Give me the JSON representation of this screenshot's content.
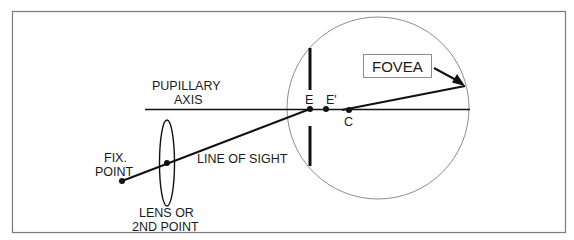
{
  "diagram": {
    "colors": {
      "background": "#ffffff",
      "frame": "#7a7a7a",
      "lines": "#111111",
      "circle": "#808080"
    },
    "labels": {
      "pupillary_axis_line1": "PUPILLARY",
      "pupillary_axis_line2": "AXIS",
      "fix_point_line1": "FIX.",
      "fix_point_line2": "POINT",
      "line_of_sight": "LINE OF SIGHT",
      "lens_line1": "LENS OR",
      "lens_line2": "2ND POINT",
      "fovea": "FOVEA",
      "point_e": "E",
      "point_e_prime": "E'",
      "point_c": "C"
    },
    "points": {
      "fix_point": [
        122,
        181
      ],
      "lens_point": [
        167,
        163
      ],
      "E": [
        310,
        109
      ],
      "E_prime": [
        326,
        109
      ],
      "C": [
        349,
        110
      ],
      "fovea": [
        465,
        86
      ]
    },
    "eyeball": {
      "cx": 378,
      "cy": 108,
      "r": 91
    }
  }
}
